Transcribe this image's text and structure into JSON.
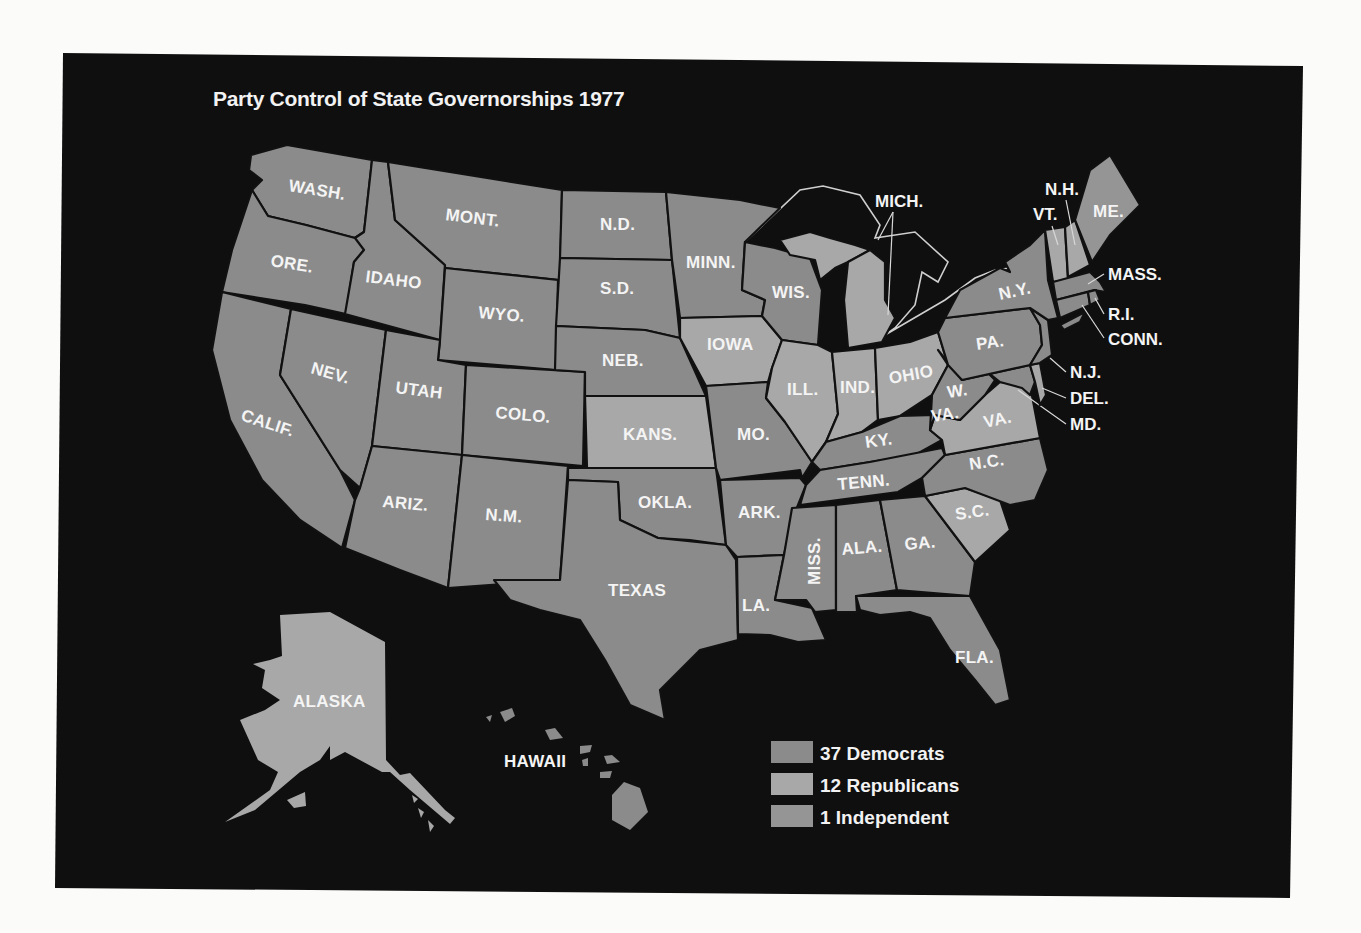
{
  "title": "Party Control of State Governorships 1977",
  "colors": {
    "background_page": "#fbfbfa",
    "panel": "#0f0f0f",
    "democrat": "#8b8b8b",
    "republican": "#a8a8a8",
    "independent": "#959595",
    "label": "#f4f4f4"
  },
  "legend": [
    {
      "key": "dem",
      "label": "37 Democrats",
      "count": 37
    },
    {
      "key": "rep",
      "label": "12 Republicans",
      "count": 12
    },
    {
      "key": "ind",
      "label": "1 Independent",
      "count": 1
    }
  ],
  "states": {
    "wash": {
      "label": "WASH.",
      "party": "dem"
    },
    "ore": {
      "label": "ORE.",
      "party": "dem"
    },
    "calif": {
      "label": "CALIF.",
      "party": "dem"
    },
    "idaho": {
      "label": "IDAHO",
      "party": "dem"
    },
    "nev": {
      "label": "NEV.",
      "party": "dem"
    },
    "mont": {
      "label": "MONT.",
      "party": "dem"
    },
    "wyo": {
      "label": "WYO.",
      "party": "dem"
    },
    "utah": {
      "label": "UTAH",
      "party": "dem"
    },
    "colo": {
      "label": "COLO.",
      "party": "dem"
    },
    "ariz": {
      "label": "ARIZ.",
      "party": "dem"
    },
    "nm": {
      "label": "N.M.",
      "party": "dem"
    },
    "nd": {
      "label": "N.D.",
      "party": "dem"
    },
    "sd": {
      "label": "S.D.",
      "party": "dem"
    },
    "neb": {
      "label": "NEB.",
      "party": "dem"
    },
    "kans": {
      "label": "KANS.",
      "party": "rep"
    },
    "okla": {
      "label": "OKLA.",
      "party": "dem"
    },
    "texas": {
      "label": "TEXAS",
      "party": "dem"
    },
    "minn": {
      "label": "MINN.",
      "party": "dem"
    },
    "iowa": {
      "label": "IOWA",
      "party": "rep"
    },
    "mo": {
      "label": "MO.",
      "party": "dem"
    },
    "ark": {
      "label": "ARK.",
      "party": "dem"
    },
    "la": {
      "label": "LA.",
      "party": "dem"
    },
    "wis": {
      "label": "WIS.",
      "party": "dem"
    },
    "ill": {
      "label": "ILL.",
      "party": "rep"
    },
    "mich": {
      "label": "MICH.",
      "party": "rep"
    },
    "ind": {
      "label": "IND.",
      "party": "rep"
    },
    "ohio": {
      "label": "OHIO",
      "party": "rep"
    },
    "ky": {
      "label": "KY.",
      "party": "dem"
    },
    "tenn": {
      "label": "TENN.",
      "party": "dem"
    },
    "miss": {
      "label": "MISS.",
      "party": "dem"
    },
    "ala": {
      "label": "ALA.",
      "party": "dem"
    },
    "ga": {
      "label": "GA.",
      "party": "dem"
    },
    "fla": {
      "label": "FLA.",
      "party": "dem"
    },
    "sc": {
      "label": "S.C.",
      "party": "rep"
    },
    "nc": {
      "label": "N.C.",
      "party": "dem"
    },
    "va": {
      "label": "VA.",
      "party": "rep"
    },
    "wva": {
      "label_1": "W.",
      "label_2": "VA.",
      "party": "dem"
    },
    "md": {
      "label": "MD.",
      "party": "dem"
    },
    "del": {
      "label": "DEL.",
      "party": "rep"
    },
    "nj": {
      "label": "N.J.",
      "party": "dem"
    },
    "pa": {
      "label": "PA.",
      "party": "dem"
    },
    "ny": {
      "label": "N.Y.",
      "party": "dem"
    },
    "vt": {
      "label": "VT.",
      "party": "rep"
    },
    "nh": {
      "label": "N.H.",
      "party": "rep"
    },
    "me": {
      "label": "ME.",
      "party": "ind"
    },
    "mass": {
      "label": "MASS.",
      "party": "dem"
    },
    "ri": {
      "label": "R.I.",
      "party": "dem"
    },
    "conn": {
      "label": "CONN.",
      "party": "dem"
    },
    "alaska": {
      "label": "ALASKA",
      "party": "rep"
    },
    "hawaii": {
      "label": "HAWAII",
      "party": "dem"
    }
  }
}
